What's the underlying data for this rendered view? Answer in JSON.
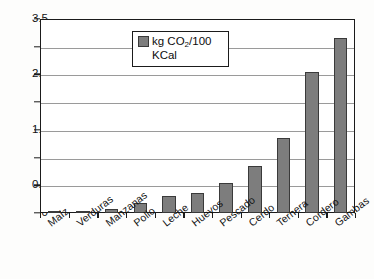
{
  "chart_data": {
    "type": "bar",
    "title": "",
    "xlabel": "",
    "ylabel": "",
    "categories": [
      "Maíz",
      "Verduras",
      "Manzanas",
      "Pollo",
      "Leche",
      "Huevos",
      "Pescado",
      "Cerdo",
      "Ternera",
      "Cordero",
      "Gambas"
    ],
    "values": [
      0.03,
      0.03,
      0.08,
      0.18,
      0.3,
      0.36,
      0.55,
      0.85,
      1.35,
      2.55,
      3.15
    ],
    "series": [
      {
        "name": "kg CO2/100 KCal",
        "values": [
          0.03,
          0.03,
          0.08,
          0.18,
          0.3,
          0.36,
          0.55,
          0.85,
          1.35,
          2.55,
          3.15
        ]
      }
    ],
    "ylim": [
      0,
      3.5
    ],
    "ytick_labels": [
      "0",
      "0.5",
      "1",
      "1.5",
      "2",
      "2.5",
      "3",
      "3.5"
    ],
    "ytick_values": [
      0,
      0.5,
      1,
      1.5,
      2,
      2.5,
      3,
      3.5
    ],
    "grid": true,
    "legend_position": "upper center",
    "bar_color": "#7d7d7d",
    "bar_border_color": "#3a3a3a",
    "gridline_color": "#9a9a9a",
    "axis_color": "#1b1b1b"
  },
  "legend": {
    "label_part1": "kg CO",
    "label_sub": "2",
    "label_part2": "/100",
    "label_line2": "KCal",
    "swatch_color": "#7d7d7d"
  }
}
